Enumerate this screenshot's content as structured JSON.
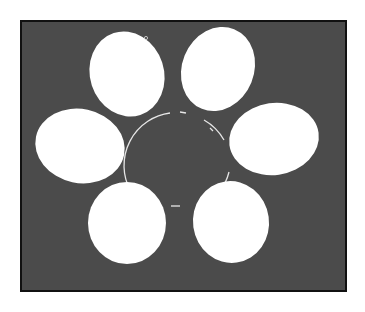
{
  "figure": {
    "background": "#ffffff",
    "panel": {
      "x": 21,
      "y": 21,
      "width": 325,
      "height": 270,
      "fill": "#4a4a4a",
      "border": "#111111"
    },
    "ovals_fill": "#ffffff",
    "ovals": [
      {
        "name": "top-left",
        "cx": 127,
        "cy": 74,
        "rx": 37,
        "ry": 43,
        "rotate": -18
      },
      {
        "name": "top-right",
        "cx": 218,
        "cy": 69,
        "rx": 36,
        "ry": 43,
        "rotate": 22
      },
      {
        "name": "middle-left",
        "cx": 80,
        "cy": 146,
        "rx": 45,
        "ry": 37,
        "rotate": 12
      },
      {
        "name": "middle-right",
        "cx": 274,
        "cy": 139,
        "rx": 45,
        "ry": 36,
        "rotate": -8
      },
      {
        "name": "bottom-left",
        "cx": 127,
        "cy": 223,
        "rx": 39,
        "ry": 41,
        "rotate": 0
      },
      {
        "name": "bottom-right",
        "cx": 231,
        "cy": 222,
        "rx": 38,
        "ry": 41,
        "rotate": -8
      }
    ],
    "center_ring": {
      "cx": 176,
      "cy": 166,
      "r": 53,
      "stroke": "#e8e8e8"
    }
  }
}
